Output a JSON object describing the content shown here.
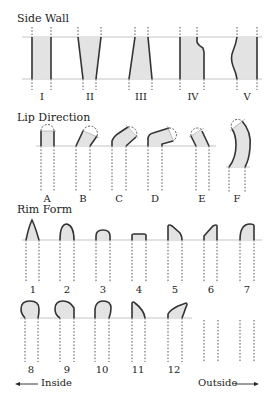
{
  "side_wall": {
    "title": "Side Wall",
    "labels": [
      "I",
      "II",
      "III",
      "IV",
      "V"
    ]
  },
  "lip_direction": {
    "title": "Lip Direction",
    "labels": [
      "A",
      "B",
      "C",
      "D",
      "E",
      "F"
    ]
  },
  "rim_form": {
    "title": "Rim Form",
    "labels_row1": [
      "1",
      "2",
      "3",
      "4",
      "5",
      "6",
      "7"
    ],
    "labels_row2": [
      "8",
      "9",
      "10",
      "11",
      "12"
    ]
  },
  "orientation": {
    "inside": "Inside",
    "outside": "Outside"
  },
  "colors": {
    "fill": "#e3e3e3",
    "stroke": "#333333",
    "guide": "#aaaaaa"
  }
}
